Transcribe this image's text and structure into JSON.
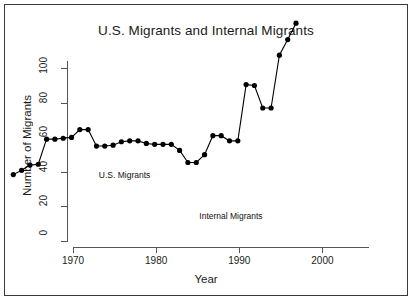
{
  "figure": {
    "title": "U.S. Migrants and Internal Migrants",
    "frame_color": "#3a3a3a",
    "background": "#ffffff"
  },
  "chart_data": {
    "type": "line",
    "title": "U.S. Migrants and Internal Migrants",
    "xlabel": "Year",
    "ylabel": "Number of Migrants",
    "xlim": [
      1970,
      2005.6
    ],
    "ylim": [
      0,
      104
    ],
    "grid": false,
    "legend": "none",
    "marker": "filled-circle",
    "line_color": "#000000",
    "marker_color": "#000000",
    "xticks": [
      1970,
      1980,
      1990,
      2000
    ],
    "xtick_labels": [
      "1970",
      "1980",
      "1990",
      "2000"
    ],
    "yticks": [
      0,
      20,
      40,
      60,
      80,
      100
    ],
    "ytick_labels": [
      "0",
      "20",
      "40",
      "60",
      "80",
      "100"
    ],
    "annotations": [
      {
        "text": "U.S. Migrants",
        "x": 1976.2,
        "y": 37.5
      },
      {
        "text": "Internal Migrants",
        "x": 1989.0,
        "y": 14.0
      }
    ],
    "series": [
      {
        "name": "Migrants",
        "x": [
          1971,
          1972,
          1973,
          1974,
          1975,
          1976,
          1977,
          1978,
          1979,
          1980,
          1981,
          1982,
          1983,
          1984,
          1985,
          1986,
          1987,
          1988,
          1989,
          1990,
          1991,
          1992,
          1993,
          1994,
          1995,
          1996,
          1997,
          1998,
          1999,
          2000,
          2001,
          2002,
          2003,
          2004,
          2005
        ],
        "values": [
          6,
          8.5,
          11.5,
          12,
          26.5,
          26.5,
          27,
          27.5,
          32,
          32,
          22.5,
          22.5,
          23,
          25,
          25.5,
          25.5,
          24,
          23.5,
          23.5,
          23.5,
          20,
          13,
          13,
          17.5,
          28.5,
          28.5,
          25.5,
          25.5,
          58,
          57.5,
          44.5,
          44.5,
          75,
          84,
          93.5
        ]
      }
    ]
  }
}
